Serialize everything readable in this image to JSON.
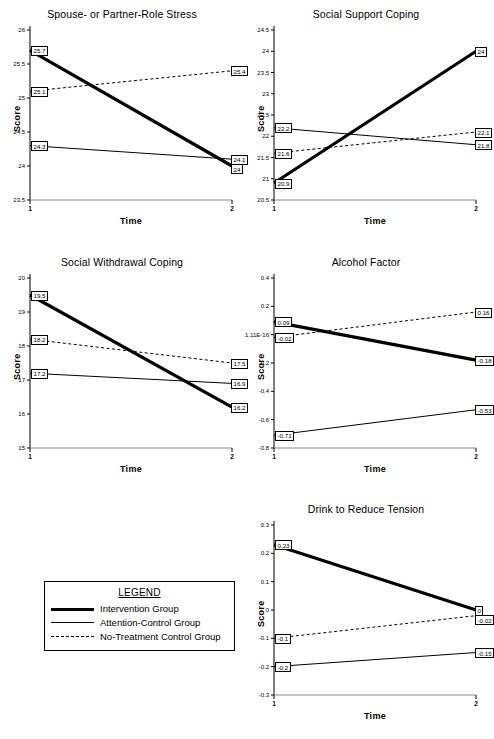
{
  "legend": {
    "title": "LEGEND",
    "entries": [
      {
        "label": "Intervention Group",
        "style": "thick-solid",
        "color": "#000000"
      },
      {
        "label": "Attention-Control Group",
        "style": "thin-solid",
        "color": "#000000"
      },
      {
        "label": "No-Treatment Control Group",
        "style": "dashed",
        "color": "#000000"
      }
    ]
  },
  "axis_labels": {
    "x": "Time",
    "y": "Score"
  },
  "chart_data": [
    {
      "type": "line",
      "title": "Spouse- or Partner-Role Stress",
      "xlabel": "Time",
      "ylabel": "Score",
      "x": [
        1,
        2
      ],
      "xticklabels": [
        "1",
        "2"
      ],
      "ylim": [
        23.5,
        26
      ],
      "yticks": [
        26,
        25.5,
        25,
        24.5,
        24,
        23.5
      ],
      "yticklabels": [
        "26",
        "25.5",
        "25",
        "24.5",
        "24",
        "23.5"
      ],
      "grid": false,
      "legend_position": "external",
      "series": [
        {
          "name": "Intervention Group",
          "style": "thick-solid",
          "values": [
            25.7,
            24
          ],
          "labels": [
            "25.7",
            "24"
          ]
        },
        {
          "name": "Attention-Control Group",
          "style": "thin-solid",
          "values": [
            24.3,
            24.1
          ],
          "labels": [
            "24.3",
            "24.1"
          ]
        },
        {
          "name": "No-Treatment Control Group",
          "style": "dashed",
          "values": [
            25.1,
            25.4
          ],
          "labels": [
            "25.1",
            "25.4"
          ]
        }
      ]
    },
    {
      "type": "line",
      "title": "Social Support Coping",
      "xlabel": "Time",
      "ylabel": "Score",
      "x": [
        1,
        2
      ],
      "xticklabels": [
        "1",
        "2"
      ],
      "ylim": [
        20.5,
        24.5
      ],
      "yticks": [
        24.5,
        24,
        23.5,
        23,
        22.5,
        22,
        21.5,
        21,
        20.5
      ],
      "yticklabels": [
        "24.5",
        "24",
        "23.5",
        "23",
        "22.5",
        "22",
        "21.5",
        "21",
        "20.5"
      ],
      "grid": false,
      "legend_position": "external",
      "series": [
        {
          "name": "Intervention Group",
          "style": "thick-solid",
          "values": [
            20.9,
            24
          ],
          "labels": [
            "20.9",
            "24"
          ]
        },
        {
          "name": "Attention-Control Group",
          "style": "thin-solid",
          "values": [
            22.2,
            21.8
          ],
          "labels": [
            "22.2",
            "21.8"
          ]
        },
        {
          "name": "No-Treatment Control Group",
          "style": "dashed",
          "values": [
            21.6,
            22.1
          ],
          "labels": [
            "21.6",
            "22.1"
          ]
        }
      ]
    },
    {
      "type": "line",
      "title": "Social Withdrawal Coping",
      "xlabel": "Time",
      "ylabel": "Score",
      "x": [
        1,
        2
      ],
      "xticklabels": [
        "1",
        "2"
      ],
      "ylim": [
        15,
        20
      ],
      "yticks": [
        20,
        19,
        18,
        17,
        16,
        15
      ],
      "yticklabels": [
        "20",
        "19",
        "18",
        "17",
        "16",
        "15"
      ],
      "grid": false,
      "legend_position": "external",
      "series": [
        {
          "name": "Intervention Group",
          "style": "thick-solid",
          "values": [
            19.5,
            16.2
          ],
          "labels": [
            "19.5",
            "16.2"
          ]
        },
        {
          "name": "Attention-Control Group",
          "style": "thin-solid",
          "values": [
            17.2,
            16.9
          ],
          "labels": [
            "17.2",
            "16.9"
          ]
        },
        {
          "name": "No-Treatment Control Group",
          "style": "dashed",
          "values": [
            18.2,
            17.5
          ],
          "labels": [
            "18.2",
            "17.5"
          ]
        }
      ]
    },
    {
      "type": "line",
      "title": "Alcohol Factor",
      "xlabel": "Time",
      "ylabel": "Score",
      "x": [
        1,
        2
      ],
      "xticklabels": [
        "1",
        "2"
      ],
      "ylim": [
        -0.8,
        0.4
      ],
      "yticks": [
        0.4,
        0.2,
        0,
        -0.2,
        -0.4,
        -0.6,
        -0.8
      ],
      "yticklabels": [
        "0.4",
        "0.2",
        "1.11E-16",
        "-0.2",
        "-0.4",
        "-0.6",
        "-0.8"
      ],
      "grid": false,
      "legend_position": "external",
      "series": [
        {
          "name": "Intervention Group",
          "style": "thick-solid",
          "values": [
            0.09,
            -0.18
          ],
          "labels": [
            "0.09",
            "-0.18"
          ]
        },
        {
          "name": "Attention-Control Group",
          "style": "thin-solid",
          "values": [
            -0.71,
            -0.53
          ],
          "labels": [
            "-0.71",
            "-0.53"
          ]
        },
        {
          "name": "No-Treatment Control Group",
          "style": "dashed",
          "values": [
            -0.02,
            0.16
          ],
          "labels": [
            "-0.02",
            "0.16"
          ]
        }
      ]
    },
    {
      "type": "line",
      "title": "Drink to Reduce Tension",
      "xlabel": "Time",
      "ylabel": "Score",
      "x": [
        1,
        2
      ],
      "xticklabels": [
        "1",
        "2"
      ],
      "ylim": [
        -0.3,
        0.3
      ],
      "yticks": [
        0.3,
        0.2,
        0.1,
        0,
        -0.1,
        -0.2,
        -0.3
      ],
      "yticklabels": [
        "0.3",
        "0.2",
        "0.1",
        "0",
        "-0.1",
        "-0.2",
        "-0.3"
      ],
      "grid": false,
      "legend_position": "external",
      "series": [
        {
          "name": "Intervention Group",
          "style": "thick-solid",
          "values": [
            0.23,
            0
          ],
          "labels": [
            "0.23",
            "0"
          ]
        },
        {
          "name": "Attention-Control Group",
          "style": "thin-solid",
          "values": [
            -0.2,
            -0.15
          ],
          "labels": [
            "-0.2",
            "-0.15"
          ]
        },
        {
          "name": "No-Treatment Control Group",
          "style": "dashed",
          "values": [
            -0.1,
            -0.02
          ],
          "labels": [
            "-0.1",
            "-0.02"
          ]
        }
      ]
    }
  ]
}
